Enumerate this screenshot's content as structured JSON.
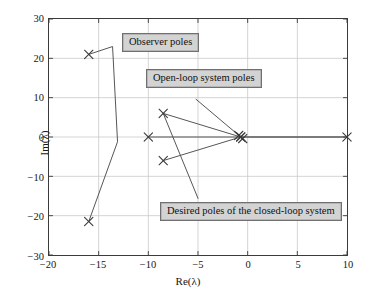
{
  "chart_data": {
    "type": "scatter",
    "title": "",
    "xlabel": "Re(λ)",
    "ylabel": "Im(λ)",
    "xlim": [
      -20,
      10
    ],
    "ylim": [
      -30,
      30
    ],
    "xticks": [
      -20,
      -15,
      -10,
      -5,
      0,
      5,
      10
    ],
    "xtick_labels": [
      "−20",
      "−15",
      "−10",
      "−5",
      "0",
      "5",
      "10"
    ],
    "yticks": [
      -30,
      -20,
      -10,
      0,
      10,
      20,
      30
    ],
    "ytick_labels": [
      "−30",
      "−20",
      "−10",
      "0",
      "10",
      "20",
      "30"
    ],
    "grid": true,
    "legend": "none",
    "marker": "x",
    "marker_color": "#3a3a3a",
    "series": [
      {
        "name": "Observer poles",
        "points": [
          {
            "x": -16.0,
            "y": 21.0
          },
          {
            "x": -16.0,
            "y": -21.5
          }
        ]
      },
      {
        "name": "Open-loop system poles",
        "points": [
          {
            "x": -10.0,
            "y": 0.0
          },
          {
            "x": -8.5,
            "y": 6.0
          },
          {
            "x": -8.5,
            "y": -6.0
          },
          {
            "x": -0.7,
            "y": 0.0
          },
          {
            "x": 10.0,
            "y": 0.0
          }
        ]
      },
      {
        "name": "Desired poles of the closed-loop system",
        "points": [
          {
            "x": -0.7,
            "y": 0.0
          },
          {
            "x": -0.9,
            "y": 0.4
          },
          {
            "x": -0.5,
            "y": -0.4
          }
        ]
      }
    ],
    "annotations": [
      {
        "id": "observer",
        "text": "Observer poles",
        "leader_from": {
          "x": -16.0,
          "y": 21.0
        },
        "leader_via": [
          {
            "x": -13.6,
            "y": 23.0
          },
          {
            "x": -13.1,
            "y": -1.2
          },
          {
            "x": -16.0,
            "y": -21.5
          }
        ]
      },
      {
        "id": "open-loop",
        "text": "Open-loop system poles",
        "leader_from": {
          "x": -5.2,
          "y": 9.6
        },
        "leader_via": [
          {
            "x": -0.7,
            "y": 0.0
          },
          {
            "x": 10.0,
            "y": 0.0
          },
          {
            "x": -10.0,
            "y": 0.0
          }
        ]
      },
      {
        "id": "desired",
        "text": "Desired poles of the closed-loop system",
        "leader_from": {
          "x": -5.0,
          "y": -15.6
        },
        "leader_via": [
          {
            "x": -8.5,
            "y": 6.0
          },
          {
            "x": -0.7,
            "y": 0.0
          },
          {
            "x": -8.5,
            "y": -6.0
          }
        ]
      }
    ]
  }
}
